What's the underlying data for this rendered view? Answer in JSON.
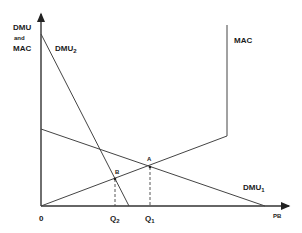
{
  "diagram": {
    "y_axis_label": {
      "line1": "DMU",
      "line2": "and",
      "line3": "MAC"
    },
    "x_axis_label": "PB",
    "origin_label": "0",
    "curves": {
      "dmu1": {
        "label": "DMU",
        "subscript": "1"
      },
      "dmu2": {
        "label": "DMU",
        "subscript": "2"
      },
      "mac": {
        "label": "MAC"
      }
    },
    "points": {
      "a": {
        "label": "A"
      },
      "b": {
        "label": "B"
      }
    },
    "x_ticks": {
      "q1": {
        "label": "Q",
        "subscript": "1"
      },
      "q2": {
        "label": "Q",
        "subscript": "2"
      }
    },
    "colors": {
      "line": "#333333",
      "text": "#1a1a1a",
      "background": "#ffffff"
    }
  }
}
